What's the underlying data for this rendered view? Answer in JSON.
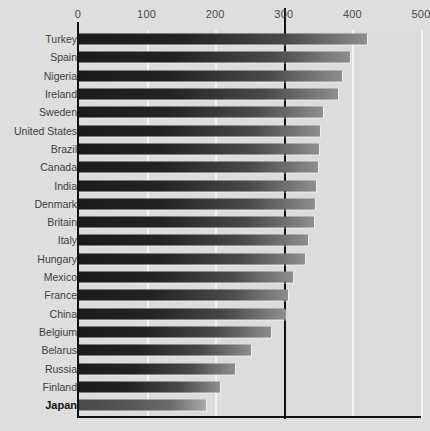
{
  "chart_data": {
    "type": "bar",
    "orientation": "horizontal",
    "title": "",
    "subtitle": "",
    "xlabel": "",
    "ylabel": "",
    "xlim": [
      0,
      500
    ],
    "ylim": null,
    "grid": true,
    "legend": null,
    "xticks": [
      0,
      100,
      200,
      300,
      400,
      500
    ],
    "xtick_labels": [
      "0",
      "100",
      "200",
      "300",
      "400",
      "500"
    ],
    "reference_line": {
      "value": 300,
      "label": "",
      "color": "#111111"
    },
    "highlight_category": "Japan",
    "categories": [
      "Turkey",
      "Spain",
      "Nigeria",
      "Ireland",
      "Sweden",
      "United States",
      "Brazil",
      "Canada",
      "India",
      "Denmark",
      "Britain",
      "Italy",
      "Hungary",
      "Mexico",
      "France",
      "China",
      "Belgium",
      "Belarus",
      "Russia",
      "Finland",
      "Japan"
    ],
    "values": [
      420,
      395,
      383,
      377,
      355,
      352,
      350,
      348,
      346,
      344,
      342,
      334,
      330,
      312,
      305,
      300,
      280,
      250,
      228,
      205,
      185
    ],
    "bars": [
      {
        "category": "Turkey",
        "value": 420,
        "highlight": false
      },
      {
        "category": "Spain",
        "value": 395,
        "highlight": false
      },
      {
        "category": "Nigeria",
        "value": 383,
        "highlight": false
      },
      {
        "category": "Ireland",
        "value": 377,
        "highlight": false
      },
      {
        "category": "Sweden",
        "value": 355,
        "highlight": false
      },
      {
        "category": "United States",
        "value": 352,
        "highlight": false
      },
      {
        "category": "Brazil",
        "value": 350,
        "highlight": false
      },
      {
        "category": "Canada",
        "value": 348,
        "highlight": false
      },
      {
        "category": "India",
        "value": 346,
        "highlight": false
      },
      {
        "category": "Denmark",
        "value": 344,
        "highlight": false
      },
      {
        "category": "Britain",
        "value": 342,
        "highlight": false
      },
      {
        "category": "Italy",
        "value": 334,
        "highlight": false
      },
      {
        "category": "Hungary",
        "value": 330,
        "highlight": false
      },
      {
        "category": "Mexico",
        "value": 312,
        "highlight": false
      },
      {
        "category": "France",
        "value": 305,
        "highlight": false
      },
      {
        "category": "China",
        "value": 300,
        "highlight": false
      },
      {
        "category": "Belgium",
        "value": 280,
        "highlight": false
      },
      {
        "category": "Belarus",
        "value": 250,
        "highlight": false
      },
      {
        "category": "Russia",
        "value": 228,
        "highlight": false
      },
      {
        "category": "Finland",
        "value": 205,
        "highlight": false
      },
      {
        "category": "Japan",
        "value": 185,
        "highlight": true
      }
    ],
    "colors": {
      "background": "#dcdcdc",
      "gridline": "#f2f2f2",
      "axis": "#111111",
      "bar_start": "#1b1b1b",
      "bar_end": "#8e8e8e",
      "bar_highlight_start": "#4a4a4a",
      "bar_highlight_end": "#a9a9a9",
      "label": "#3d3d3d"
    }
  }
}
